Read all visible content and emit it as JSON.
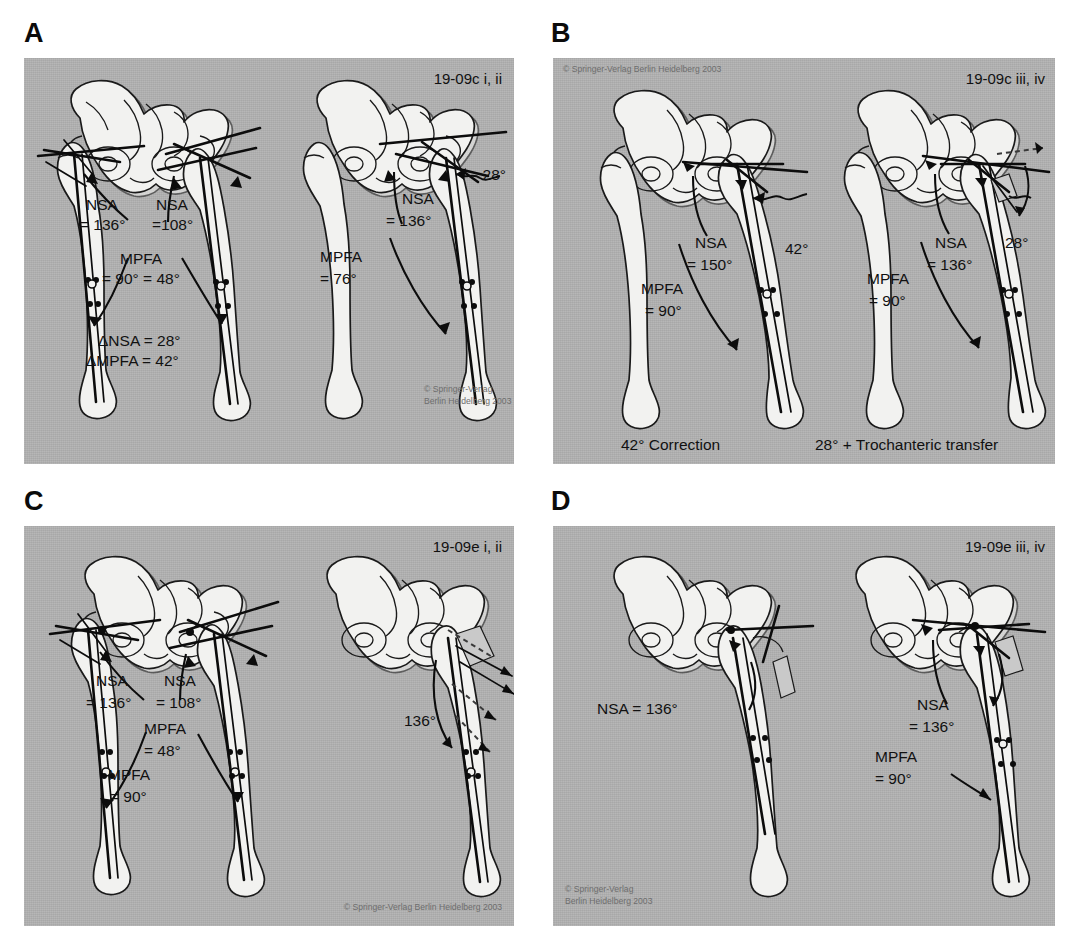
{
  "figure": {
    "panels": [
      {
        "letter": "A",
        "figure_id": "19-09c i, ii",
        "copyright_line1": "© Springer-Verlag",
        "copyright_line2": "Berlin Heidelberg 2003",
        "copyright_position": "bottom-right",
        "sub_images": [
          {
            "name": "bilateral-hips-comparison",
            "annotations": [
              {
                "name": "nsa-left",
                "line1": "NSA",
                "line2": "= 136°"
              },
              {
                "name": "nsa-right",
                "line1": "NSA",
                "line2": "=108°"
              },
              {
                "name": "mpfa-header",
                "line1": "MPFA",
                "line2": "= 90°  = 48°"
              },
              {
                "name": "delta-nsa",
                "line1": "ΔNSA = 28°"
              },
              {
                "name": "delta-mpfa",
                "line1": "ΔMPFA = 42°"
              }
            ]
          },
          {
            "name": "single-hip-deformity",
            "annotations": [
              {
                "name": "nsa",
                "line1": "NSA",
                "line2": "= 136°"
              },
              {
                "name": "mpfa",
                "line1": "MPFA",
                "line2": "= 76°"
              },
              {
                "name": "angle-callout",
                "line1": "28°"
              }
            ]
          }
        ]
      },
      {
        "letter": "B",
        "figure_id": "19-09c iii, iv",
        "copyright_line1": "© Springer-Verlag Berlin Heidelberg 2003",
        "copyright_position": "top-left",
        "sub_images": [
          {
            "name": "correction-42",
            "caption": "42° Correction",
            "annotations": [
              {
                "name": "nsa",
                "line1": "NSA",
                "line2": "= 150°"
              },
              {
                "name": "mpfa",
                "line1": "MPFA",
                "line2": "= 90°"
              },
              {
                "name": "angle-callout",
                "line1": "42°"
              }
            ]
          },
          {
            "name": "correction-28-trochanteric-transfer",
            "caption": "28° + Trochanteric transfer",
            "annotations": [
              {
                "name": "nsa",
                "line1": "NSA",
                "line2": "= 136°"
              },
              {
                "name": "mpfa",
                "line1": "MPFA",
                "line2": "= 90°"
              },
              {
                "name": "angle-callout",
                "line1": "28°"
              }
            ]
          }
        ]
      },
      {
        "letter": "C",
        "figure_id": "19-09e i, ii",
        "copyright_line1": "© Springer-Verlag Berlin Heidelberg 2003",
        "copyright_position": "bottom-right",
        "sub_images": [
          {
            "name": "bilateral-hips-comparison",
            "annotations": [
              {
                "name": "nsa-left",
                "line1": "NSA",
                "line2": "= 136°"
              },
              {
                "name": "nsa-right",
                "line1": "NSA",
                "line2": "= 108°"
              },
              {
                "name": "mpfa-right",
                "line1": "MPFA",
                "line2": "= 48°"
              },
              {
                "name": "mpfa-left",
                "line1": "MPFA",
                "line2": "= 90°"
              }
            ]
          },
          {
            "name": "osteotomy-displacement",
            "annotations": [
              {
                "name": "angle-callout",
                "line1": "136°"
              }
            ]
          }
        ]
      },
      {
        "letter": "D",
        "figure_id": "19-09e iii, iv",
        "copyright_line1": "© Springer-Verlag",
        "copyright_line2": "Berlin Heidelberg 2003",
        "copyright_position": "bottom-left",
        "sub_images": [
          {
            "name": "post-osteotomy-left",
            "annotations": [
              {
                "name": "nsa",
                "line1": "NSA = 136°"
              }
            ]
          },
          {
            "name": "post-osteotomy-right",
            "annotations": [
              {
                "name": "nsa",
                "line1": "NSA",
                "line2": "= 136°"
              },
              {
                "name": "mpfa",
                "line1": "MPFA",
                "line2": "= 90°"
              }
            ]
          }
        ]
      }
    ]
  },
  "colors": {
    "plate_background": "#b2b2b2",
    "bone_fill": "#f2f2f0",
    "ink": "#111111",
    "shade_fill": "#c9c9c9",
    "copyright_text": "#6d6d6d",
    "page_background": "#ffffff"
  }
}
